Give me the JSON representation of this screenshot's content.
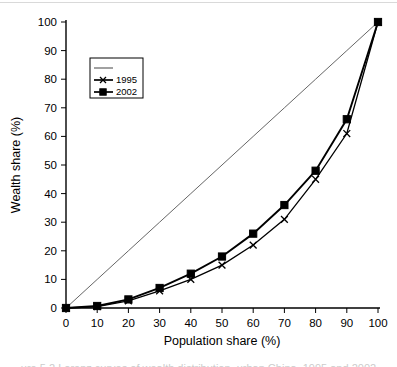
{
  "figure": {
    "background": "#ffffff",
    "width": 397,
    "height": 367,
    "caption_partial": "ure 5.2  Lorenz curves of wealth distribution, urban China, 1995 and 2002"
  },
  "axes": {
    "x_title": "Population share (%)",
    "y_title": "Wealth share (%)",
    "x_ticks": [
      "0",
      "10",
      "20",
      "30",
      "40",
      "50",
      "60",
      "70",
      "80",
      "90",
      "100"
    ],
    "y_ticks": [
      "0",
      "10",
      "20",
      "30",
      "40",
      "50",
      "60",
      "70",
      "80",
      "90",
      "100"
    ],
    "xlim": [
      0,
      100
    ],
    "ylim": [
      0,
      100
    ]
  },
  "legend": {
    "position": "upper-left-inside",
    "entries": [
      {
        "label": "",
        "marker": "none",
        "name": "equality-line"
      },
      {
        "label": "1995",
        "marker": "x",
        "name": "series-1995"
      },
      {
        "label": "2002",
        "marker": "square",
        "name": "series-2002"
      }
    ]
  },
  "chart_data": {
    "type": "line",
    "title": "",
    "xlabel": "Population share (%)",
    "ylabel": "Wealth share (%)",
    "xlim": [
      0,
      100
    ],
    "ylim": [
      0,
      100
    ],
    "grid": false,
    "legend_position": "upper left",
    "x": [
      0,
      10,
      20,
      30,
      40,
      50,
      60,
      70,
      80,
      90,
      100
    ],
    "series": [
      {
        "name": "line of equality",
        "marker": "none",
        "color": "#555555",
        "values": [
          0,
          10,
          20,
          30,
          40,
          50,
          60,
          70,
          80,
          90,
          100
        ]
      },
      {
        "name": "1995",
        "marker": "x",
        "color": "#000000",
        "values": [
          0,
          0.5,
          2.5,
          6,
          10,
          15,
          22,
          31,
          45,
          61,
          100
        ]
      },
      {
        "name": "2002",
        "marker": "square",
        "color": "#000000",
        "values": [
          0,
          0.7,
          3,
          7,
          12,
          18,
          26,
          36,
          48,
          66,
          100
        ]
      }
    ]
  }
}
